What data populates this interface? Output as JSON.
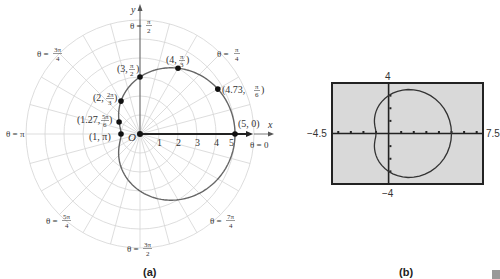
{
  "chart_data": [
    {
      "type": "line",
      "subtype": "polar",
      "title": "",
      "caption": "(a)",
      "equation": "r = 3 + 2cos(theta)",
      "xlabel": "x",
      "ylabel": "y",
      "origin_label": "O",
      "grid": true,
      "radial_ticks": [
        "1",
        "2",
        "3",
        "4",
        "5"
      ],
      "angle_labels": [
        {
          "label": "θ = 0",
          "angle": "0"
        },
        {
          "label": "θ = π/4",
          "angle": "π/4"
        },
        {
          "label": "θ = π/2",
          "angle": "π/2"
        },
        {
          "label": "θ = 3π/4",
          "angle": "3π/4"
        },
        {
          "label": "θ = π",
          "angle": "π"
        },
        {
          "label": "θ = 5π/4",
          "angle": "5π/4"
        },
        {
          "label": "θ = 3π/2",
          "angle": "3π/2"
        },
        {
          "label": "θ = 7π/4",
          "angle": "7π/4"
        }
      ],
      "points": [
        {
          "label": "(5, 0)",
          "r": 5,
          "theta": "0"
        },
        {
          "label": "(4.73, π/6)",
          "r": 4.73,
          "theta": "π/6"
        },
        {
          "label": "(4, π/3)",
          "r": 4,
          "theta": "π/3"
        },
        {
          "label": "(3, π/2)",
          "r": 3,
          "theta": "π/2"
        },
        {
          "label": "(2, 2π/3)",
          "r": 2,
          "theta": "2π/3"
        },
        {
          "label": "(1.27, 5π/6)",
          "r": 1.27,
          "theta": "5π/6"
        },
        {
          "label": "(1, π)",
          "r": 1,
          "theta": "π"
        }
      ]
    },
    {
      "type": "line",
      "subtype": "calculator-window",
      "caption": "(b)",
      "xlim": [
        -4.5,
        7.5
      ],
      "ylim": [
        -4,
        4
      ],
      "tick_labels": {
        "xmin": "-4.5",
        "xmax": "7.5",
        "ymin": "-4",
        "ymax": "4"
      },
      "equation": "r = 3 + 2cos(theta)"
    }
  ],
  "labels": {
    "x_axis": "x",
    "y_axis": "y",
    "origin": "O",
    "theta0": "θ = 0",
    "theta_pi": "θ = π",
    "ticks": [
      "1",
      "2",
      "3",
      "4",
      "5"
    ],
    "pts": [
      "(5, 0)",
      "(4.73,",
      "(4,",
      "(3,",
      "(2,",
      "(1.27,",
      "(1, π)"
    ],
    "caption_a": "(a)",
    "caption_b": "(b)",
    "calc_ymax": "4",
    "calc_ymin": "−4",
    "calc_xmin": "−4.5",
    "calc_xmax": "7.5"
  }
}
